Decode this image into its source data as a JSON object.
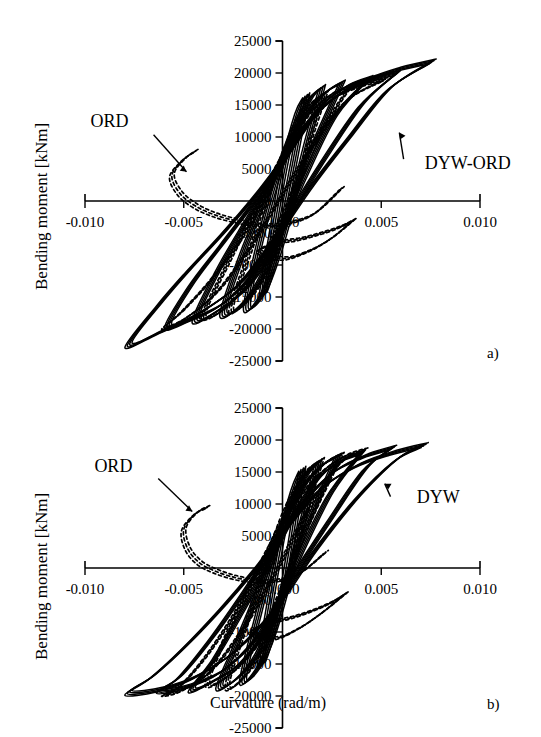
{
  "figure": {
    "axis_label_y": "Bending moment [kNm]",
    "axis_label_x": "Curvature (rad/m)",
    "panel_a_letter": "a)",
    "panel_b_letter": "b)"
  },
  "chart_data": [
    {
      "type": "line",
      "panel": "a)",
      "title": "",
      "xlabel": "Curvature (rad/m)",
      "ylabel": "Bending moment [kNm]",
      "xlim": [
        -0.01,
        0.01
      ],
      "ylim": [
        -25000,
        25000
      ],
      "xticks": [
        -0.01,
        -0.005,
        0,
        0.005,
        0.01
      ],
      "xticklabels": [
        "-0.010",
        "-0.005",
        "0.000",
        "0.005",
        "0.010"
      ],
      "yticks": [
        -25000,
        -20000,
        -15000,
        -10000,
        -5000,
        0,
        5000,
        10000,
        15000,
        20000,
        25000
      ],
      "yticklabels": [
        "-25000",
        "-20000",
        "-15000",
        "-10000",
        "-5000",
        "0",
        "5000",
        "10000",
        "15000",
        "20000",
        "25000"
      ],
      "grid": false,
      "legend": "annotations",
      "annotations": [
        {
          "label": "ORD",
          "x": -0.0078,
          "y": 11500,
          "points_to_x": -0.0047,
          "points_to_y": 4200,
          "linestyle": "dashed"
        },
        {
          "label": "DYW-ORD",
          "x": 0.0072,
          "y": 5000,
          "points_to_x": 0.0058,
          "points_to_y": 11200,
          "linestyle": "solid"
        }
      ],
      "series": [
        {
          "name": "DYW-ORD outer loop",
          "linestyle": "solid",
          "x": [
            0.0076,
            0.0058,
            0.0036,
            0.0018,
            0.0004,
            -0.0012,
            -0.003,
            -0.0048,
            -0.0062,
            -0.0078,
            -0.0062,
            -0.0042,
            -0.0022,
            -0.0004,
            0.0014,
            0.0034,
            0.0054,
            0.0076
          ],
          "y": [
            21800,
            20500,
            18000,
            14000,
            8000,
            1500,
            -5000,
            -11000,
            -16000,
            -22500,
            -20500,
            -17500,
            -13000,
            -6000,
            2000,
            10000,
            17500,
            21800
          ]
        },
        {
          "name": "DYW-ORD loop 2",
          "linestyle": "solid",
          "x": [
            0.0058,
            0.0044,
            0.0028,
            0.0012,
            0.0,
            -0.0014,
            -0.003,
            -0.0046,
            -0.0058,
            -0.0046,
            -0.003,
            -0.0014,
            0.0002,
            0.002,
            0.004,
            0.0058
          ],
          "y": [
            20000,
            18800,
            16500,
            12000,
            6500,
            0,
            -6500,
            -13000,
            -19500,
            -18500,
            -16000,
            -11000,
            -3000,
            6000,
            15000,
            20000
          ]
        },
        {
          "name": "DYW-ORD loop 3",
          "linestyle": "solid",
          "x": [
            0.0044,
            0.0032,
            0.002,
            0.0008,
            -0.0004,
            -0.0018,
            -0.0032,
            -0.0044,
            -0.0032,
            -0.0018,
            -0.0004,
            0.001,
            0.0026,
            0.0044
          ],
          "y": [
            19200,
            17800,
            15000,
            10000,
            4000,
            -3000,
            -10500,
            -18500,
            -17000,
            -13500,
            -7000,
            3000,
            13000,
            19200
          ]
        },
        {
          "name": "DYW-ORD loop 4",
          "linestyle": "solid",
          "x": [
            0.003,
            0.0022,
            0.0012,
            0.0002,
            -0.0008,
            -0.002,
            -0.003,
            -0.002,
            -0.001,
            0.0,
            0.0012,
            0.003
          ],
          "y": [
            18500,
            17000,
            13500,
            8000,
            1000,
            -8000,
            -17500,
            -16000,
            -11500,
            -4000,
            6000,
            18500
          ]
        },
        {
          "name": "DYW-ORD loop 5",
          "linestyle": "solid",
          "x": [
            0.002,
            0.0014,
            0.0006,
            -0.0002,
            -0.001,
            -0.0018,
            -0.001,
            -0.0003,
            0.0004,
            0.0012,
            0.002
          ],
          "y": [
            17800,
            16000,
            11500,
            4500,
            -4500,
            -16500,
            -14500,
            -9000,
            -1500,
            8500,
            17800
          ]
        },
        {
          "name": "DYW-ORD inner loops",
          "linestyle": "solid",
          "x": [
            0.0012,
            0.0008,
            0.0002,
            -0.0004,
            -0.001,
            -0.0005,
            0.0,
            0.0006,
            0.0012
          ],
          "y": [
            16500,
            14000,
            7000,
            -3000,
            -14500,
            -10000,
            -3000,
            6500,
            16500
          ]
        },
        {
          "name": "ORD outer loop",
          "linestyle": "dashed",
          "x": [
            0.0052,
            0.004,
            0.0026,
            0.001,
            -0.0004,
            -0.0018,
            -0.0034,
            -0.005,
            -0.006,
            -0.005,
            -0.0034,
            -0.0018,
            -0.0002,
            0.0014,
            0.0032,
            0.0052
          ],
          "y": [
            19000,
            18000,
            16000,
            11000,
            3500,
            -4500,
            -11500,
            -17000,
            -19800,
            -18500,
            -14500,
            -8000,
            0,
            8000,
            15500,
            19000
          ]
        },
        {
          "name": "ORD branch",
          "linestyle": "dashed",
          "x": [
            -0.0044,
            -0.005,
            -0.0056,
            -0.0052,
            -0.0044,
            -0.0034,
            -0.0022,
            -0.001,
            0.0002,
            0.0016,
            0.003
          ],
          "y": [
            7800,
            6500,
            4000,
            1200,
            -800,
            -2200,
            -3200,
            -3800,
            -3500,
            -2000,
            2000
          ]
        },
        {
          "name": "ORD loop 2",
          "linestyle": "dashed",
          "x": [
            0.0034,
            0.0024,
            0.0012,
            0.0,
            -0.0014,
            -0.0028,
            -0.004,
            -0.0028,
            -0.0014,
            0.0,
            0.0014,
            0.0034
          ],
          "y": [
            17800,
            16500,
            13000,
            7000,
            -1500,
            -10000,
            -18000,
            -16500,
            -11000,
            -2500,
            8000,
            17800
          ]
        },
        {
          "name": "ORD loop 3",
          "linestyle": "dashed",
          "x": [
            0.0022,
            0.0014,
            0.0004,
            -0.0006,
            -0.0016,
            -0.0026,
            -0.0016,
            -0.0006,
            0.0004,
            0.0014,
            0.0022
          ],
          "y": [
            17000,
            15000,
            10000,
            2000,
            -7500,
            -17000,
            -15000,
            -9500,
            -1000,
            9500,
            17000
          ]
        },
        {
          "name": "ORD negative branch",
          "linestyle": "dashed",
          "x": [
            0.0036,
            0.0028,
            0.0018,
            0.0008,
            -0.0002,
            -0.0012,
            0.0,
            0.0012,
            0.0024,
            0.0036
          ],
          "y": [
            -3000,
            -4200,
            -5200,
            -6000,
            -6500,
            -7800,
            -9000,
            -8000,
            -6000,
            -3000
          ]
        }
      ]
    },
    {
      "type": "line",
      "panel": "b)",
      "title": "",
      "xlabel": "Curvature (rad/m)",
      "ylabel": "Bending moment [kNm]",
      "xlim": [
        -0.01,
        0.01
      ],
      "ylim": [
        -25000,
        25000
      ],
      "xticks": [
        -0.01,
        -0.005,
        0,
        0.005,
        0.01
      ],
      "xticklabels": [
        "-0.010",
        "-0.005",
        "0.000",
        "0.005",
        "0.010"
      ],
      "yticks": [
        -25000,
        -20000,
        -15000,
        -10000,
        -5000,
        0,
        5000,
        10000,
        15000,
        20000,
        25000
      ],
      "yticklabels": [
        "-25000",
        "-20000",
        "-15000",
        "-10000",
        "-5000",
        "0",
        "5000",
        "10000",
        "15000",
        "20000",
        "25000"
      ],
      "grid": false,
      "legend": "annotations",
      "annotations": [
        {
          "label": "ORD",
          "x": -0.0076,
          "y": 15000,
          "points_to_x": -0.0044,
          "points_to_y": 8500,
          "linestyle": "dashed"
        },
        {
          "label": "DYW",
          "x": 0.0068,
          "y": 10200,
          "points_to_x": 0.005,
          "points_to_y": 13500,
          "linestyle": "solid"
        }
      ],
      "series": [
        {
          "name": "DYW outer loop",
          "linestyle": "solid",
          "x": [
            0.0072,
            0.0056,
            0.0038,
            0.002,
            0.0004,
            -0.0012,
            -0.003,
            -0.005,
            -0.0066,
            -0.0078,
            -0.0062,
            -0.0044,
            -0.0024,
            -0.0004,
            0.0016,
            0.0038,
            0.0058,
            0.0072
          ],
          "y": [
            19200,
            18000,
            16000,
            12500,
            7000,
            500,
            -6000,
            -12500,
            -17000,
            -19500,
            -19000,
            -17000,
            -13000,
            -6500,
            2500,
            11000,
            17000,
            19200
          ]
        },
        {
          "name": "DYW loop 2",
          "linestyle": "solid",
          "x": [
            0.0056,
            0.0042,
            0.0026,
            0.001,
            -0.0004,
            -0.002,
            -0.0036,
            -0.0052,
            -0.0062,
            -0.0048,
            -0.003,
            -0.0012,
            0.0004,
            0.0024,
            0.0042,
            0.0056
          ],
          "y": [
            18800,
            17500,
            15000,
            10000,
            3500,
            -4000,
            -11000,
            -17000,
            -19200,
            -18500,
            -16000,
            -10500,
            -2000,
            7500,
            15500,
            18800
          ]
        },
        {
          "name": "DYW loop 3",
          "linestyle": "solid",
          "x": [
            0.004,
            0.003,
            0.0018,
            0.0006,
            -0.0006,
            -0.002,
            -0.0034,
            -0.0046,
            -0.0034,
            -0.002,
            -0.0006,
            0.0008,
            0.0024,
            0.004
          ],
          "y": [
            18000,
            16800,
            14000,
            8500,
            1500,
            -6500,
            -14000,
            -19000,
            -17500,
            -14500,
            -8500,
            1500,
            11500,
            18000
          ]
        },
        {
          "name": "DYW loop 4",
          "linestyle": "solid",
          "x": [
            0.0028,
            0.002,
            0.001,
            0.0,
            -0.001,
            -0.0022,
            -0.0032,
            -0.0022,
            -0.0012,
            -0.0002,
            0.001,
            0.0028
          ],
          "y": [
            17500,
            16000,
            12500,
            6000,
            -2000,
            -11000,
            -18500,
            -17000,
            -13000,
            -5500,
            5000,
            17500
          ]
        },
        {
          "name": "DYW loop 5",
          "linestyle": "solid",
          "x": [
            0.0018,
            0.0012,
            0.0004,
            -0.0004,
            -0.0012,
            -0.002,
            -0.0012,
            -0.0005,
            0.0002,
            0.001,
            0.0018
          ],
          "y": [
            16500,
            14500,
            10000,
            2500,
            -7000,
            -17500,
            -15500,
            -10500,
            -3000,
            7000,
            16500
          ]
        },
        {
          "name": "DYW inner loops",
          "linestyle": "solid",
          "x": [
            0.001,
            0.0006,
            0.0,
            -0.0006,
            -0.0011,
            -0.0006,
            0.0,
            0.0005,
            0.001
          ],
          "y": [
            15500,
            12500,
            5500,
            -5000,
            -15000,
            -11000,
            -4000,
            5000,
            15500
          ]
        },
        {
          "name": "ORD outer loop",
          "linestyle": "dashed",
          "x": [
            0.0042,
            0.0032,
            0.002,
            0.0006,
            -0.0008,
            -0.0022,
            -0.0038,
            -0.0052,
            -0.006,
            -0.005,
            -0.0036,
            -0.002,
            -0.0004,
            0.0012,
            0.0028,
            0.0042
          ],
          "y": [
            18500,
            17500,
            15000,
            10000,
            2500,
            -6000,
            -13500,
            -18500,
            -19800,
            -19000,
            -16000,
            -9500,
            -1000,
            8500,
            16000,
            18500
          ]
        },
        {
          "name": "ORD branch",
          "linestyle": "dashed",
          "x": [
            -0.0038,
            -0.0044,
            -0.005,
            -0.0048,
            -0.0042,
            -0.0034,
            -0.0024,
            -0.0014,
            -0.0004,
            0.0008,
            0.0022
          ],
          "y": [
            9500,
            8500,
            6000,
            3000,
            800,
            -500,
            -1500,
            -2000,
            -2000,
            -1000,
            2500
          ]
        },
        {
          "name": "ORD loop 2",
          "linestyle": "dashed",
          "x": [
            0.003,
            0.0022,
            0.0012,
            0.0,
            -0.0012,
            -0.0026,
            -0.0038,
            -0.0026,
            -0.0012,
            0.0,
            0.0014,
            0.003
          ],
          "y": [
            17800,
            16500,
            13500,
            7500,
            -500,
            -9000,
            -18000,
            -16500,
            -11500,
            -3000,
            7500,
            17800
          ]
        },
        {
          "name": "ORD loop 3",
          "linestyle": "dashed",
          "x": [
            0.002,
            0.0012,
            0.0002,
            -0.0008,
            -0.0018,
            -0.0028,
            -0.0018,
            -0.0008,
            0.0002,
            0.0012,
            0.002
          ],
          "y": [
            17000,
            15000,
            9500,
            1000,
            -8500,
            -18500,
            -16500,
            -11000,
            -2000,
            9000,
            17000
          ]
        },
        {
          "name": "ORD negative branch",
          "linestyle": "dashed",
          "x": [
            0.0032,
            0.0024,
            0.0014,
            0.0004,
            -0.0006,
            -0.0016,
            -0.0004,
            0.0008,
            0.002,
            0.0032
          ],
          "y": [
            -4000,
            -5500,
            -6800,
            -7800,
            -8500,
            -10000,
            -11000,
            -9500,
            -7000,
            -4000
          ]
        }
      ]
    }
  ]
}
